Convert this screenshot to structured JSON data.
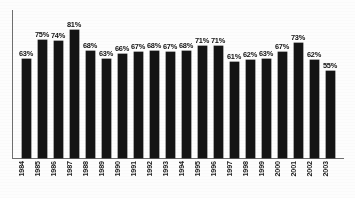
{
  "chart_data": {
    "type": "bar",
    "title": "",
    "subtitle": "",
    "xlabel": "",
    "ylabel": "",
    "categories": [
      "1984",
      "1985",
      "1986",
      "1987",
      "1988",
      "1989",
      "1990",
      "1991",
      "1992",
      "1993",
      "1994",
      "1995",
      "1996",
      "1997",
      "1998",
      "1999",
      "2000",
      "2001",
      "2002",
      "2003"
    ],
    "values": [
      63,
      75,
      74,
      81,
      68,
      63,
      66,
      67,
      68,
      67,
      68,
      71,
      71,
      61,
      62,
      63,
      67,
      73,
      62,
      55
    ],
    "value_labels": [
      "63%",
      "75%",
      "74%",
      "81%",
      "68%",
      "63%",
      "66%",
      "67%",
      "68%",
      "67%",
      "68%",
      "71%",
      "71%",
      "61%",
      "62%",
      "63%",
      "67%",
      "73%",
      "62%",
      "55%"
    ],
    "ylim": [
      0,
      88
    ],
    "grid": false,
    "legend": null,
    "series": [
      {
        "name": "",
        "values": [
          63,
          75,
          74,
          81,
          68,
          63,
          66,
          67,
          68,
          67,
          68,
          71,
          71,
          61,
          62,
          63,
          67,
          73,
          62,
          55
        ]
      }
    ],
    "bar_color": "#141414",
    "axis_color": "#6f6f6f",
    "label_rotation": -90,
    "units": "percent"
  },
  "caption": {
    "text": ""
  }
}
